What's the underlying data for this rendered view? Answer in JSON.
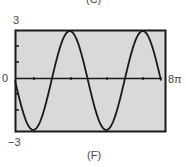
{
  "top_caption": "(C)",
  "caption": "(F)",
  "labels": {
    "ymax": "3",
    "ymin": "−3",
    "x0": "0",
    "xmax": "8π"
  },
  "colors": {
    "plot_bg": "#d9d9d9",
    "frame": "#1a1a1a",
    "curve": "#1a1a1a"
  },
  "chart_data": {
    "type": "line",
    "title": "(F)",
    "xlabel": "",
    "ylabel": "",
    "xlim": [
      0,
      25.1327
    ],
    "ylim": [
      -3,
      3
    ],
    "x_tick_labels": [
      "0",
      "8π"
    ],
    "y_tick_labels": [
      "3",
      "-3"
    ],
    "x_ticks": [
      "2π",
      "4π",
      "6π"
    ],
    "grid": false,
    "series": [
      {
        "name": "y = -3 sin(x/2)",
        "x": [
          0,
          3.1416,
          6.2832,
          9.4248,
          12.5664,
          15.708,
          18.8496,
          21.9911,
          25.1327
        ],
        "values": [
          0,
          -3,
          0,
          3,
          0,
          -3,
          0,
          3,
          0
        ]
      }
    ]
  }
}
